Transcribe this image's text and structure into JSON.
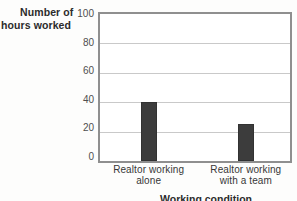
{
  "chart_data": {
    "type": "bar",
    "title": "",
    "ylabel": "Number of hours worked",
    "ylabel_lines": [
      "Number of",
      "hours worked"
    ],
    "xlabel": "Working condition",
    "categories": [
      "Realtor working alone",
      "Realtor working with a team"
    ],
    "category_lines": [
      [
        "Realtor working",
        "alone"
      ],
      [
        "Realtor working",
        "with a team"
      ]
    ],
    "values": [
      40,
      25
    ],
    "ylim": [
      0,
      100
    ],
    "yticks": [
      0,
      20,
      40,
      60,
      80,
      100
    ],
    "grid": true,
    "legend": "none",
    "bar_color": "#3c3c3c",
    "grid_color": "#c9c9c9",
    "axis_color": "#8f8f8f",
    "tick_label_color": "#4f4f4f",
    "title_color": "#2b2b2b"
  }
}
